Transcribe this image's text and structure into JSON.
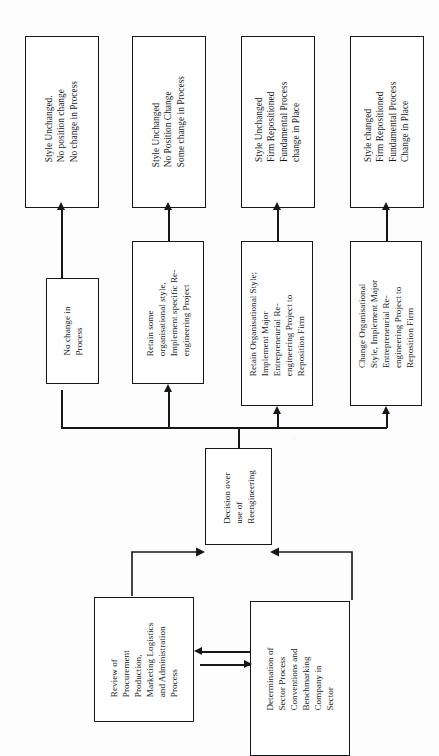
{
  "page": {
    "running_head": "",
    "width": 439,
    "height": 756,
    "orientation": "rotated-90-ccw",
    "ink_color": "#14181c",
    "paper_color": "#fdfdfd"
  },
  "diagram": {
    "title": "Decision over use of Reengineering",
    "outcomes": [
      {
        "id": "outcome-1",
        "text": "Style Unchanged.\nNo position change\nNo change in Process"
      },
      {
        "id": "outcome-2",
        "text": "Style Unchanged\nNo Position Change\nSome change in Process"
      },
      {
        "id": "outcome-3",
        "text": "Style Unchanged\nFirm Repositioned\nFundamental Process\nchange in Place"
      },
      {
        "id": "outcome-4",
        "text": "Style changed\nFirm Repositioned\nFundamental Process\nChange in Place"
      }
    ],
    "actions": [
      {
        "id": "action-1",
        "text": "No change in\nProcess"
      },
      {
        "id": "action-2",
        "text": "Retain some\norganisational style,\nImplement specific Re-\nengineering Project"
      },
      {
        "id": "action-3",
        "text": "Retain Organisational Style;\nImplement Major\nEntrepreneurial Re-\nengineering Project to\nReposition Firm"
      },
      {
        "id": "action-4",
        "text": "Change Organisational\nStyle, Implement Major\nEntrepreneurial Re-\nengineering Project to\nReposition Firm"
      }
    ],
    "decision": {
      "id": "decision-node",
      "text": "Decision over\nuse of\nReengineering"
    },
    "inputs": [
      {
        "id": "input-review",
        "text": "Review of\nProcurement\nProduction,\nMarketing Logistics\nand Administration\nProcess"
      },
      {
        "id": "input-sector",
        "text": "Determination of\nSector Process\nConventions and\nBenchmarking\nCompany in\nSector"
      }
    ],
    "connector_labels": {
      "outcome_arrows": "arrow-up",
      "decision_feed": "arrow-up",
      "review_to_decision": "arrow-diagonal",
      "sector_to_decision": "arrow-diagonal",
      "inputs_exchange": "arrow-bidirectional"
    }
  }
}
